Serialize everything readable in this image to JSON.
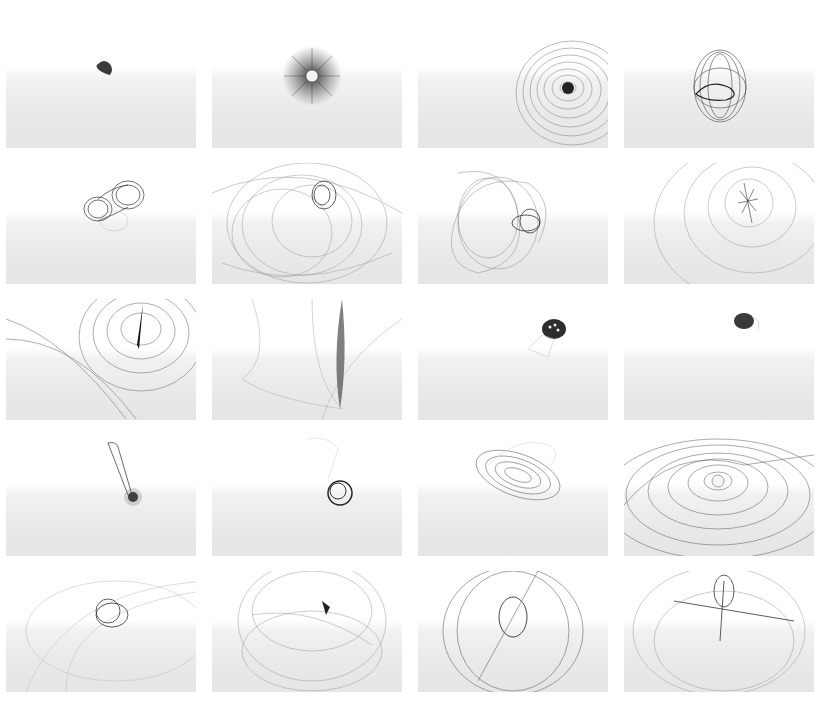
{
  "figure": {
    "rows": 5,
    "columns": 4,
    "background_top": "#ffffff",
    "background_bottom": "#e5e5e5",
    "stroke_color": "#3a3a3a",
    "panels": [
      {
        "index": 1,
        "motif": "small dense blob"
      },
      {
        "index": 2,
        "motif": "radial starburst with light center"
      },
      {
        "index": 3,
        "motif": "concentric spiral rings, dark center"
      },
      {
        "index": 4,
        "motif": "egg-shaped wire mesh"
      },
      {
        "index": 5,
        "motif": "twin-lobed wire coil"
      },
      {
        "index": 6,
        "motif": "wide looping scribble with dense knot"
      },
      {
        "index": 7,
        "motif": "tangled scribble ball"
      },
      {
        "index": 8,
        "motif": "large arcs around dense cluster"
      },
      {
        "index": 9,
        "motif": "concentric rings with vertical dark spike"
      },
      {
        "index": 10,
        "motif": "vertical dense streak with sweeping lines"
      },
      {
        "index": 11,
        "motif": "small dark bowl with trailing mesh"
      },
      {
        "index": 12,
        "motif": "small dark capsule"
      },
      {
        "index": 13,
        "motif": "tapered stalk with base knot"
      },
      {
        "index": 14,
        "motif": "wire knot with faint cone above"
      },
      {
        "index": 15,
        "motif": "tilted elliptical disc of rings"
      },
      {
        "index": 16,
        "motif": "wavy sheet of concentric ellipses"
      },
      {
        "index": 17,
        "motif": "coil knot with faint long loops"
      },
      {
        "index": 18,
        "motif": "sphere of loops with small knot"
      },
      {
        "index": 19,
        "motif": "large ellipse cage with central mesh"
      },
      {
        "index": 20,
        "motif": "cross-shaped mesh inside loop cage"
      }
    ]
  },
  "caption": {
    "text": ""
  }
}
